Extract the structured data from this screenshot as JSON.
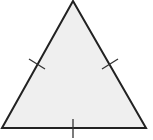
{
  "diagram": {
    "shape": "equilateral-triangle",
    "colors": {
      "fill": "#efefef",
      "stroke": "#222222",
      "background": "#ffffff"
    },
    "vertices": {
      "apex": [
        73,
        1
      ],
      "bottom_left": [
        2,
        128
      ],
      "bottom_right": [
        146,
        128
      ]
    },
    "congruence_marks": {
      "count_per_side": 1,
      "sides": [
        "left",
        "right",
        "bottom"
      ]
    }
  }
}
